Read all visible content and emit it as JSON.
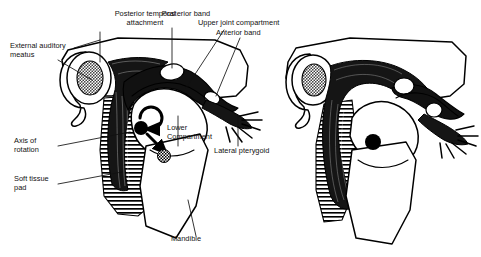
{
  "figure": {
    "width": 481,
    "height": 257,
    "background_color": "#ffffff",
    "ink_color": "#000000",
    "stipple_color": "#808080",
    "panels": [
      {
        "id": "left-panel",
        "name": "closed-position-tmj",
        "description": "TMJ with condyle seated in fossa, rotation arrows shown"
      },
      {
        "id": "right-panel",
        "name": "translated-position-tmj",
        "description": "TMJ with condyle translated forward, no callout labels"
      }
    ]
  },
  "labels": {
    "external_auditory_meatus": "External auditory\nmeatus",
    "external_auditory_meatus_l1": "External auditory",
    "external_auditory_meatus_l2": "meatus",
    "posterior_temporal_attachment_l1": "Posterior temporal",
    "posterior_temporal_attachment_l2": "attachment",
    "posterior_band": "Posterior band",
    "upper_joint_compartment": "Upper joint compartment",
    "anterior_band": "Anterior band",
    "lower_compartment_l1": "Lower",
    "lower_compartment_l2": "Compartment",
    "lateral_pterygoid": "Lateral pterygoid",
    "axis_of_rotation_l1": "Axis of",
    "axis_of_rotation_l2": "rotation",
    "soft_tissue_pad_l1": "Soft tissue",
    "soft_tissue_pad_l2": "pad",
    "mandible": "Mandible"
  },
  "markers": {
    "rotation_arrow_icon": "curved-rotation-arrow",
    "translation_arrow_icon": "straight-diagonal-arrow",
    "condyle_center_dot_icon": "solid-black-dot",
    "secondary_axis_dot_icon": "checkered-dot",
    "right_condyle_dot_icon": "solid-black-dot"
  },
  "colors": {
    "ink": "#000000",
    "meatus_fill": "#8a8a8a",
    "soft_tissue_hatch": "#000000",
    "paper": "#ffffff"
  }
}
